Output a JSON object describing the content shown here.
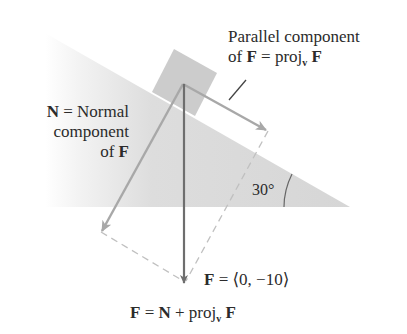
{
  "diagram": {
    "incline_angle_label": "30°",
    "parallel_label": {
      "line1": "Parallel component",
      "line2_prefix": "of ",
      "line2_F": "F",
      "line2_eq": " = proj",
      "line2_sub": "v",
      "line2_F2": " F"
    },
    "normal_label": {
      "line1_N": "N",
      "line1_rest": " = Normal",
      "line2": "component",
      "line3_prefix": "of ",
      "line3_F": "F"
    },
    "force_label": {
      "F": "F",
      "rest": " = ⟨0, −10⟩"
    },
    "equation": {
      "F": "F",
      "eq": " = ",
      "N": "N",
      "plus": " + proj",
      "sub": "v",
      "F2": " F"
    },
    "colors": {
      "incline": "#d6d6d6",
      "block": "#c4c4c4",
      "force_arrow": "#6e6e6e",
      "component_arrows": "#a8a8a8",
      "dashed": "#c0c0c0",
      "text": "#2b2b2b"
    }
  }
}
